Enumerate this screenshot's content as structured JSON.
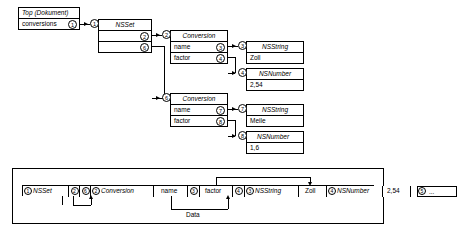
{
  "diagram": {
    "title_hidden": "",
    "objects": {
      "top": {
        "header": "Top (Dokument)",
        "field": "conversions",
        "tag": "1"
      },
      "nsset": {
        "tag": "1",
        "title": "NSSet",
        "elements": [
          {
            "tag": "2"
          },
          {
            "tag": "6"
          }
        ]
      },
      "conversion_a": {
        "tag": "2",
        "title": "Conversion",
        "fields": [
          {
            "label": "name",
            "tag": "3"
          },
          {
            "label": "factor",
            "tag": "4"
          }
        ]
      },
      "conversion_b": {
        "tag": "6",
        "title": "Conversion",
        "fields": [
          {
            "label": "name",
            "tag": "7"
          },
          {
            "label": "factor",
            "tag": "8"
          }
        ]
      },
      "nsstring_a": {
        "tag": "3",
        "title": "NSString",
        "value": "Zoll"
      },
      "nsnumber_a": {
        "tag": "4",
        "title": "NSNumber",
        "value": "2,54"
      },
      "nsstring_b": {
        "tag": "7",
        "title": "NSString",
        "value": "Meile"
      },
      "nsnumber_b": {
        "tag": "8",
        "title": "NSNumber",
        "value": "1,6"
      }
    }
  },
  "stream": {
    "label": "Data",
    "cells": [
      {
        "tag": "1",
        "text": "NSSet",
        "italic": true,
        "type": "class"
      },
      {
        "tag": "2",
        "text": "",
        "italic": false,
        "type": "ref"
      },
      {
        "tag": "6",
        "text": "",
        "italic": false,
        "type": "ref"
      },
      {
        "tag": "2",
        "text": "Conversion",
        "italic": true,
        "type": "class"
      },
      {
        "tag": "",
        "text": "name",
        "italic": false,
        "type": "key"
      },
      {
        "tag": "3",
        "text": "",
        "italic": false,
        "type": "ref"
      },
      {
        "tag": "",
        "text": "factor",
        "italic": false,
        "type": "key"
      },
      {
        "tag": "4",
        "text": "",
        "italic": false,
        "type": "ref"
      },
      {
        "tag": "3",
        "text": "NSString",
        "italic": true,
        "type": "class"
      },
      {
        "tag": "",
        "text": "Zoll",
        "italic": false,
        "type": "value"
      },
      {
        "tag": "4",
        "text": "NSNumber",
        "italic": true,
        "type": "class"
      },
      {
        "tag": "",
        "text": "2,54",
        "italic": false,
        "type": "value"
      },
      {
        "tag": "5",
        "text": "...",
        "italic": false,
        "type": "more"
      }
    ]
  }
}
